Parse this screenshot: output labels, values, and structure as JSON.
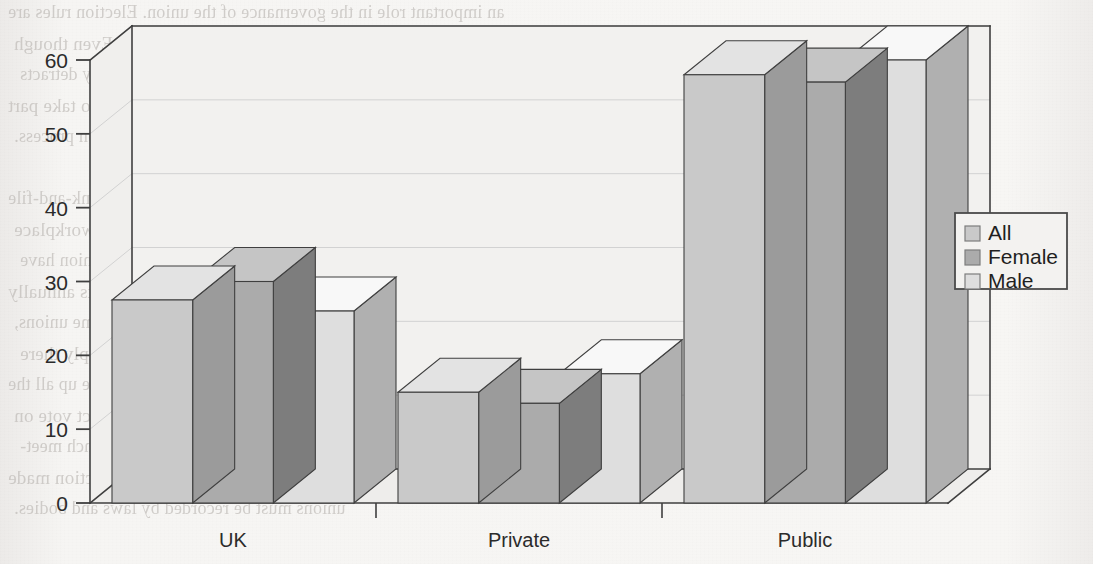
{
  "page": {
    "background_color": "#f4f3f1",
    "bleed_text_color": "#b9b5b1",
    "bleed_lines": [
      "an important role in the governance of the union. Election rules are",
      "often stricter in unions that are, such as the Electoral Reform Society. Even though",
      "the proportion of members attending meetings is usually very low, this in no way detracts",
      "the democratic nature of the election, because members are given the opportunity to take part",
      "in the selection process.",
      "",
      "Union leaders are usually elected by whether a rank-and-file",
      "has the chance of campaigning in and electing union policy    committee or workplace",
      "union (table 9.3). The important thing is that the rank-and-file members of the union have",
      "the supreme decision-making power of the national delegate conference, which meets annually",
      "composed of branch delegates. These conferences take place every one year in some unions,",
      "or two years among the national leadership as they are not simply there",
      "lation of policy between conferences. At local level, branches make up all the",
      "members that all have the opportunity to attend and to comment or take a direct vote on",
      "motions that come before the branch. Rules vary between unions, but at branch meet-",
      "ings it is often law the opportunity to shape policy that is presented. So, by a set of action made",
      "unions must be recorded by laws and bodies."
    ]
  },
  "chart_data": {
    "type": "bar",
    "title": "",
    "xlabel": "",
    "ylabel": "",
    "categories": [
      "UK",
      "Private",
      "Public"
    ],
    "series": [
      {
        "name": "All",
        "color": "#c9c9c9",
        "values": [
          27.5,
          15,
          58
        ]
      },
      {
        "name": "Female",
        "color": "#ababab",
        "values": [
          30,
          13.5,
          57
        ]
      },
      {
        "name": "Male",
        "color": "#dedede",
        "values": [
          26,
          17.5,
          60
        ]
      }
    ],
    "ylim": [
      0,
      60
    ],
    "yticks": [
      0,
      10,
      20,
      30,
      40,
      50,
      60
    ],
    "ytick_labels": [
      "0",
      "10",
      "20",
      "30",
      "40",
      "50",
      "60"
    ],
    "grid": true,
    "legend_position": "right",
    "three_d": true,
    "frame_color": "#3f3f3f",
    "grid_color": "#d2d2d2",
    "plot_bg": "#f2f1ef"
  },
  "legend": {
    "items": [
      {
        "label": "All",
        "swatch": "#c9c9c9"
      },
      {
        "label": "Female",
        "swatch": "#ababab"
      },
      {
        "label": "Male",
        "swatch": "#dedede"
      }
    ],
    "border_color": "#4a4a4a",
    "background": "#f3f2f0"
  }
}
